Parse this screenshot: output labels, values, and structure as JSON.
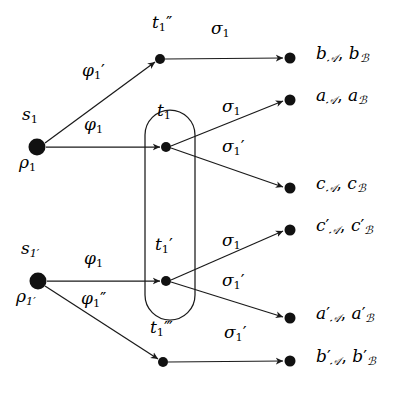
{
  "figure": {
    "type": "petri-net-transition-diagram",
    "width": 407,
    "height": 406,
    "background_color": "#ffffff",
    "stroke_color": "#1a1a1a"
  },
  "nodes": [
    {
      "id": "s1",
      "kind": "source-place",
      "x": 37,
      "y": 147,
      "radius": 8,
      "filled": true,
      "label_above": "s₁",
      "label_above_base": "s",
      "label_above_sub": "1",
      "label_below": "ρ₁",
      "label_below_base": "ρ",
      "label_below_sub": "1"
    },
    {
      "id": "s1prime",
      "kind": "source-place",
      "x": 38,
      "y": 281,
      "radius": 8,
      "filled": true,
      "label_above": "s₁′",
      "label_above_base": "s",
      "label_above_sub": "1′",
      "label_below": "ρ₁′",
      "label_below_base": "ρ",
      "label_below_sub": "1′"
    },
    {
      "id": "t1dprime",
      "kind": "transition",
      "x": 160,
      "y": 59,
      "radius": 5,
      "filled": true,
      "label": "t₁″",
      "label_base": "t",
      "label_sub": "1",
      "label_prime": "″"
    },
    {
      "id": "t1",
      "kind": "transition",
      "x": 166,
      "y": 147,
      "radius": 5,
      "filled": true,
      "label": "t₁",
      "label_base": "t",
      "label_sub": "1",
      "label_prime": ""
    },
    {
      "id": "t1prime",
      "kind": "transition",
      "x": 166,
      "y": 281,
      "radius": 5,
      "filled": true,
      "label": "t₁′",
      "label_base": "t",
      "label_sub": "1",
      "label_prime": "′"
    },
    {
      "id": "t1tprime",
      "kind": "transition",
      "x": 163,
      "y": 362,
      "radius": 5,
      "filled": true,
      "label": "t₁‴",
      "label_base": "t",
      "label_sub": "1",
      "label_prime": "‴"
    }
  ],
  "group_box": {
    "name": "merged-transition-group",
    "x": 145,
    "y": 110,
    "width": 50,
    "height": 210,
    "corner_radius": 25,
    "stroke": "#1a1a1a",
    "fill": "none"
  },
  "edges": [
    {
      "id": "e-s1-t1dprime",
      "from": "s1",
      "to": "t1dprime",
      "label": "φ₁′",
      "label_base": "φ",
      "label_sub": "1",
      "label_prime": "′",
      "label_x": 82,
      "label_y": 68,
      "x1": 45,
      "y1": 143,
      "x2": 155,
      "y2": 62
    },
    {
      "id": "e-s1-t1",
      "from": "s1",
      "to": "t1",
      "label": "φ₁",
      "label_base": "φ",
      "label_sub": "1",
      "label_prime": "",
      "label_x": 84,
      "label_y": 122,
      "x1": 46,
      "y1": 147,
      "x2": 160,
      "y2": 147
    },
    {
      "id": "e-s1prime-t1prime",
      "from": "s1prime",
      "to": "t1prime",
      "label": "φ₁",
      "label_base": "φ",
      "label_sub": "1",
      "label_prime": "",
      "label_x": 84,
      "label_y": 256,
      "x1": 47,
      "y1": 281,
      "x2": 160,
      "y2": 281
    },
    {
      "id": "e-s1prime-t1tprime",
      "from": "s1prime",
      "to": "t1tprime",
      "label": "φ₁″",
      "label_base": "φ",
      "label_sub": "1",
      "label_prime": "″",
      "label_x": 82,
      "label_y": 296,
      "x1": 45,
      "y1": 286,
      "x2": 158,
      "y2": 359
    },
    {
      "id": "e-t1dprime-out",
      "from": "t1dprime",
      "to": "out-b",
      "label": "σ₁",
      "label_base": "σ",
      "label_sub": "1",
      "label_prime": "",
      "label_x": 211,
      "label_y": 26,
      "x1": 165,
      "y1": 59,
      "x2": 286,
      "y2": 58
    },
    {
      "id": "e-t1-out-a",
      "from": "t1",
      "to": "out-a",
      "label": "σ₁",
      "label_base": "σ",
      "label_sub": "1",
      "label_prime": "",
      "label_x": 222,
      "label_y": 104,
      "x1": 171,
      "y1": 146,
      "x2": 286,
      "y2": 100
    },
    {
      "id": "e-t1-out-c",
      "from": "t1",
      "to": "out-c",
      "label": "σ₁′",
      "label_base": "σ",
      "label_sub": "1",
      "label_prime": "′",
      "label_x": 222,
      "label_y": 144,
      "x1": 171,
      "y1": 148,
      "x2": 286,
      "y2": 188
    },
    {
      "id": "e-t1prime-out-cp",
      "from": "t1prime",
      "to": "out-cp",
      "label": "σ₁",
      "label_base": "σ",
      "label_sub": "1",
      "label_prime": "",
      "label_x": 222,
      "label_y": 238,
      "x1": 171,
      "y1": 280,
      "x2": 286,
      "y2": 230
    },
    {
      "id": "e-t1prime-out-ap",
      "from": "t1prime",
      "to": "out-ap",
      "label": "σ₁′",
      "label_base": "σ",
      "label_sub": "1",
      "label_prime": "′",
      "label_x": 222,
      "label_y": 278,
      "x1": 171,
      "y1": 282,
      "x2": 286,
      "y2": 318
    },
    {
      "id": "e-t1tprime-out-bp",
      "from": "t1tprime",
      "to": "out-bp",
      "label": "σ₁′",
      "label_base": "σ",
      "label_sub": "1",
      "label_prime": "′",
      "label_x": 224,
      "label_y": 330,
      "x1": 168,
      "y1": 362,
      "x2": 286,
      "y2": 361
    }
  ],
  "outputs": [
    {
      "id": "out-b",
      "x": 290,
      "y": 58,
      "radius": 5,
      "label": "b𝒜, bℬ",
      "base": "b",
      "prime": "",
      "sub_a": "𝒜",
      "sub_b": "ℬ",
      "label_x": 317,
      "label_y": 46
    },
    {
      "id": "out-a",
      "x": 290,
      "y": 100,
      "radius": 5,
      "label": "a𝒜, aℬ",
      "base": "a",
      "prime": "",
      "sub_a": "𝒜",
      "sub_b": "ℬ",
      "label_x": 317,
      "label_y": 88
    },
    {
      "id": "out-c",
      "x": 290,
      "y": 188,
      "radius": 5,
      "label": "c𝒜, cℬ",
      "base": "c",
      "prime": "",
      "sub_a": "𝒜",
      "sub_b": "ℬ",
      "label_x": 317,
      "label_y": 176
    },
    {
      "id": "out-cp",
      "x": 290,
      "y": 230,
      "radius": 5,
      "label": "c′𝒜, c′ℬ",
      "base": "c",
      "prime": "′",
      "sub_a": "𝒜",
      "sub_b": "ℬ",
      "label_x": 317,
      "label_y": 218
    },
    {
      "id": "out-ap",
      "x": 290,
      "y": 318,
      "radius": 5,
      "label": "a′𝒜, a′ℬ",
      "base": "a",
      "prime": "′",
      "sub_a": "𝒜",
      "sub_b": "ℬ",
      "label_x": 317,
      "label_y": 306
    },
    {
      "id": "out-bp",
      "x": 290,
      "y": 361,
      "radius": 5,
      "label": "b′𝒜, b′ℬ",
      "base": "b",
      "prime": "′",
      "sub_a": "𝒜",
      "sub_b": "ℬ",
      "label_x": 317,
      "label_y": 349
    }
  ],
  "node_labels": [
    {
      "id": "lbl-t1dprime",
      "text": "t₁″",
      "x": 152,
      "y": 20
    },
    {
      "id": "lbl-t1",
      "text": "t₁",
      "x": 156,
      "y": 108
    },
    {
      "id": "lbl-t1prime",
      "text": "t₁′",
      "x": 154,
      "y": 242
    },
    {
      "id": "lbl-t1tprime",
      "text": "t₁‴",
      "x": 152,
      "y": 325
    },
    {
      "id": "lbl-s1",
      "text": "s₁",
      "x": 22,
      "y": 112
    },
    {
      "id": "lbl-rho1",
      "text": "ρ₁",
      "x": 20,
      "y": 159
    },
    {
      "id": "lbl-s1prime",
      "text": "s₁′",
      "x": 21,
      "y": 246
    },
    {
      "id": "lbl-rho1prime",
      "text": "ρ₁′",
      "x": 17,
      "y": 293
    }
  ]
}
